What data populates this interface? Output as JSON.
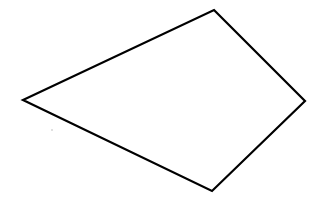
{
  "diagram": {
    "shape": "quadrilateral",
    "vertices": [
      {
        "x": 214,
        "y": 10
      },
      {
        "x": 305,
        "y": 101
      },
      {
        "x": 212,
        "y": 191
      },
      {
        "x": 23,
        "y": 100
      }
    ],
    "stroke_color": "#000000",
    "stroke_width": 2.2,
    "fill": "#ffffff",
    "background": "#ffffff",
    "speck": {
      "x": 52,
      "y": 130,
      "color": "#b8b8b8"
    }
  }
}
